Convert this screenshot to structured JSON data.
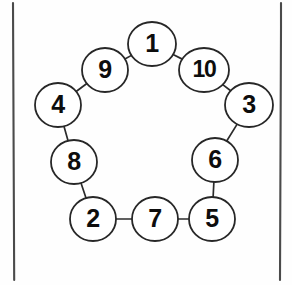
{
  "figure": {
    "type": "graph-diagram",
    "background_color": "#fefefe",
    "node_fill_color": "#ffffff",
    "node_stroke_color": "#272727",
    "edge_color": "#2b2b2b",
    "frame_color": "#4a4a4a",
    "label_color": "#0d0d0d"
  },
  "frame": {
    "left_x": 13,
    "right_x": 281,
    "top_y": 3,
    "bottom_y": 280
  },
  "nodes": [
    {
      "label": "1",
      "cx": 152,
      "cy": 44,
      "rx": 24,
      "ry": 22,
      "wide": false
    },
    {
      "label": "9",
      "cx": 105,
      "cy": 70,
      "rx": 23,
      "ry": 22,
      "wide": false
    },
    {
      "label": "10",
      "cx": 204,
      "cy": 70,
      "rx": 25,
      "ry": 22,
      "wide": true
    },
    {
      "label": "4",
      "cx": 58,
      "cy": 105,
      "rx": 23,
      "ry": 22,
      "wide": false
    },
    {
      "label": "3",
      "cx": 249,
      "cy": 105,
      "rx": 24,
      "ry": 22,
      "wide": false
    },
    {
      "label": "8",
      "cx": 74,
      "cy": 162,
      "rx": 23,
      "ry": 22,
      "wide": false
    },
    {
      "label": "6",
      "cx": 215,
      "cy": 160,
      "rx": 23,
      "ry": 22,
      "wide": false
    },
    {
      "label": "2",
      "cx": 93,
      "cy": 219,
      "rx": 23,
      "ry": 22,
      "wide": false
    },
    {
      "label": "7",
      "cx": 155,
      "cy": 219,
      "rx": 23,
      "ry": 22,
      "wide": false
    },
    {
      "label": "5",
      "cx": 212,
      "cy": 219,
      "rx": 23,
      "ry": 22,
      "wide": false
    }
  ],
  "edges": [
    {
      "from": "1",
      "to": "9"
    },
    {
      "from": "9",
      "to": "4"
    },
    {
      "from": "4",
      "to": "8"
    },
    {
      "from": "8",
      "to": "2"
    },
    {
      "from": "2",
      "to": "7"
    },
    {
      "from": "7",
      "to": "5"
    },
    {
      "from": "5",
      "to": "6"
    },
    {
      "from": "6",
      "to": "3"
    },
    {
      "from": "3",
      "to": "10"
    },
    {
      "from": "10",
      "to": "1"
    }
  ]
}
